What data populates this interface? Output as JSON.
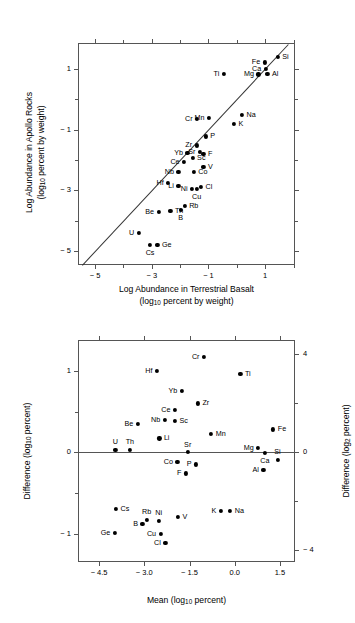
{
  "figure": {
    "type": "two-panel-scientific-figure"
  },
  "chart_data": [
    {
      "type": "scatter",
      "panel": "top",
      "title": "",
      "xlabel": "Log Abundance in Terrestrial Basalt (log10 percent by weight)",
      "ylabel": "Log Abundance in Apollo Rocks (log10 percent by weight)",
      "xlabel_line1": "Log Abundance in Terrestrial Basalt",
      "xlabel_line2_pre": "(log",
      "xlabel_line2_sub": "10",
      "xlabel_line2_post": " percent by weight)",
      "ylabel_line1": "Log Abundance in Apollo Rocks",
      "ylabel_line2_pre": "(log",
      "ylabel_line2_sub": "10",
      "ylabel_line2_post": " percent by weight)",
      "xlim": [
        -5.6,
        2.05
      ],
      "ylim": [
        -5.45,
        1.85
      ],
      "xticks_major": [
        -5,
        -3,
        -1,
        1
      ],
      "xticks_major_labels": [
        "− 5",
        "− 3",
        "− 1",
        "1"
      ],
      "xticks_minor": [
        -4,
        -2,
        0,
        2
      ],
      "yticks_major": [
        1,
        -1,
        -3,
        -5
      ],
      "yticks_major_labels": [
        "1",
        "− 1",
        "− 3",
        "− 5"
      ],
      "yticks_minor": [
        0,
        -2,
        -4
      ],
      "grid": false,
      "reference_line": {
        "type": "identity",
        "label": "y = x",
        "from": [
          -5.45,
          -5.45
        ],
        "to": [
          1.82,
          1.82
        ]
      },
      "points": [
        {
          "label": "Si",
          "x": 1.44,
          "y": 1.4,
          "pos": "r"
        },
        {
          "label": "Fe",
          "x": 0.98,
          "y": 1.21,
          "pos": "l"
        },
        {
          "label": "Ca",
          "x": 1.02,
          "y": 1.0,
          "pos": "l"
        },
        {
          "label": "Al",
          "x": 1.08,
          "y": 0.83,
          "pos": "r"
        },
        {
          "label": "Mg",
          "x": 0.76,
          "y": 0.82,
          "pos": "l"
        },
        {
          "label": "Ti",
          "x": -0.46,
          "y": 0.83,
          "pos": "l"
        },
        {
          "label": "Na",
          "x": 0.18,
          "y": -0.52,
          "pos": "r"
        },
        {
          "label": "K",
          "x": -0.1,
          "y": -0.82,
          "pos": "r"
        },
        {
          "label": "Mn",
          "x": -0.98,
          "y": -0.62,
          "pos": "l"
        },
        {
          "label": "Cr",
          "x": -1.4,
          "y": -0.64,
          "pos": "l"
        },
        {
          "label": "P",
          "x": -1.1,
          "y": -1.22,
          "pos": "r"
        },
        {
          "label": "Zr",
          "x": -1.42,
          "y": -1.52,
          "pos": "l"
        },
        {
          "label": "Sr",
          "x": -1.3,
          "y": -1.72,
          "pos": "l"
        },
        {
          "label": "F",
          "x": -1.18,
          "y": -1.8,
          "pos": "r"
        },
        {
          "label": "Yb",
          "x": -1.74,
          "y": -1.76,
          "pos": "l"
        },
        {
          "label": "Sc",
          "x": -1.56,
          "y": -1.94,
          "pos": "r"
        },
        {
          "label": "Ce",
          "x": -1.86,
          "y": -2.06,
          "pos": "l"
        },
        {
          "label": "V",
          "x": -1.18,
          "y": -2.22,
          "pos": "r"
        },
        {
          "label": "Nb",
          "x": -2.06,
          "y": -2.4,
          "pos": "l"
        },
        {
          "label": "Co",
          "x": -1.52,
          "y": -2.4,
          "pos": "r"
        },
        {
          "label": "Hf",
          "x": -2.42,
          "y": -2.74,
          "pos": "l"
        },
        {
          "label": "Li",
          "x": -2.06,
          "y": -2.84,
          "pos": "l"
        },
        {
          "label": "Cl",
          "x": -1.26,
          "y": -2.88,
          "pos": "r"
        },
        {
          "label": "Ni",
          "x": -1.58,
          "y": -2.94,
          "pos": "l"
        },
        {
          "label": "Cu",
          "x": -1.42,
          "y": -2.94,
          "pos": "b"
        },
        {
          "label": "Rb",
          "x": -1.84,
          "y": -3.5,
          "pos": "r"
        },
        {
          "label": "B",
          "x": -1.98,
          "y": -3.64,
          "pos": "b"
        },
        {
          "label": "Th",
          "x": -2.34,
          "y": -3.68,
          "pos": "r"
        },
        {
          "label": "Be",
          "x": -2.76,
          "y": -3.7,
          "pos": "l"
        },
        {
          "label": "U",
          "x": -3.46,
          "y": -4.4,
          "pos": "l"
        },
        {
          "label": "Cs",
          "x": -3.06,
          "y": -4.78,
          "pos": "b"
        },
        {
          "label": "Ge",
          "x": -2.8,
          "y": -4.8,
          "pos": "r"
        }
      ]
    },
    {
      "type": "scatter",
      "panel": "bottom",
      "title": "",
      "xlabel": "Mean (log10 percent)",
      "ylabel": "Difference (log10 percent)",
      "ylabel_right": "Difference (log2 percent)",
      "xlabel_pre": "Mean (log",
      "xlabel_sub": "10",
      "xlabel_post": " percent)",
      "ylabel_pre": "Difference (log",
      "ylabel_sub": "10",
      "ylabel_post": " percent)",
      "ylabel_right_pre": "Difference (log",
      "ylabel_right_sub": "2",
      "ylabel_right_post": " percent)",
      "xlim": [
        -5.2,
        2.0
      ],
      "ylim": [
        -1.35,
        1.38
      ],
      "xticks_major": [
        -4.5,
        -3.0,
        -1.5,
        0.0,
        1.5
      ],
      "xticks_major_labels": [
        "− 4.5",
        "− 3.0",
        "− 1.5",
        "0.0",
        "1.5"
      ],
      "yticks_major": [
        1,
        0,
        -1
      ],
      "yticks_major_labels": [
        "1",
        "0",
        "− 1"
      ],
      "yticks_minor": [
        0.5,
        -0.5
      ],
      "yticks_right_major": [
        4,
        0,
        -4
      ],
      "yticks_right_major_labels": [
        "4",
        "0",
        "− 4"
      ],
      "yticks_right_minor": [
        2,
        -2
      ],
      "grid": false,
      "reference_line": {
        "type": "horizontal",
        "value": 0
      },
      "points": [
        {
          "label": "Cr",
          "x": -1.02,
          "y": 1.17,
          "pos": "l"
        },
        {
          "label": "Hf",
          "x": -2.58,
          "y": 1.0,
          "pos": "l"
        },
        {
          "label": "Ti",
          "x": 0.19,
          "y": 0.96,
          "pos": "r"
        },
        {
          "label": "Yb",
          "x": -1.76,
          "y": 0.75,
          "pos": "l"
        },
        {
          "label": "Zr",
          "x": -1.22,
          "y": 0.6,
          "pos": "r"
        },
        {
          "label": "Ce",
          "x": -1.98,
          "y": 0.52,
          "pos": "l"
        },
        {
          "label": "Nb",
          "x": -2.32,
          "y": 0.4,
          "pos": "l"
        },
        {
          "label": "Sc",
          "x": -1.98,
          "y": 0.39,
          "pos": "r"
        },
        {
          "label": "Be",
          "x": -3.22,
          "y": 0.35,
          "pos": "l"
        },
        {
          "label": "Fe",
          "x": 1.28,
          "y": 0.28,
          "pos": "r"
        },
        {
          "label": "Mn",
          "x": -0.78,
          "y": 0.23,
          "pos": "r"
        },
        {
          "label": "Li",
          "x": -2.5,
          "y": 0.17,
          "pos": "r"
        },
        {
          "label": "Mg",
          "x": 0.78,
          "y": 0.05,
          "pos": "l"
        },
        {
          "label": "U",
          "x": -3.96,
          "y": 0.03,
          "pos": "t"
        },
        {
          "label": "Th",
          "x": -3.48,
          "y": 0.03,
          "pos": "t"
        },
        {
          "label": "Sr",
          "x": -1.56,
          "y": 0.0,
          "pos": "t"
        },
        {
          "label": "Ca",
          "x": 1.0,
          "y": -0.01,
          "pos": "b"
        },
        {
          "label": "Si",
          "x": 1.42,
          "y": -0.09,
          "pos": "t"
        },
        {
          "label": "Co",
          "x": -1.9,
          "y": -0.12,
          "pos": "l"
        },
        {
          "label": "P",
          "x": -1.28,
          "y": -0.15,
          "pos": "l"
        },
        {
          "label": "Al",
          "x": 0.95,
          "y": -0.22,
          "pos": "l"
        },
        {
          "label": "F",
          "x": -1.62,
          "y": -0.26,
          "pos": "l"
        },
        {
          "label": "Cs",
          "x": -3.94,
          "y": -0.7,
          "pos": "r"
        },
        {
          "label": "K",
          "x": -0.46,
          "y": -0.72,
          "pos": "l"
        },
        {
          "label": "Na",
          "x": -0.15,
          "y": -0.72,
          "pos": "r"
        },
        {
          "label": "V",
          "x": -1.88,
          "y": -0.8,
          "pos": "r"
        },
        {
          "label": "Rb",
          "x": -2.92,
          "y": -0.83,
          "pos": "t"
        },
        {
          "label": "Ni",
          "x": -2.52,
          "y": -0.84,
          "pos": "t"
        },
        {
          "label": "B",
          "x": -3.06,
          "y": -0.88,
          "pos": "l"
        },
        {
          "label": "Ge",
          "x": -3.98,
          "y": -0.99,
          "pos": "l"
        },
        {
          "label": "Cu",
          "x": -2.46,
          "y": -1.0,
          "pos": "l"
        },
        {
          "label": "Cl",
          "x": -2.3,
          "y": -1.12,
          "pos": "l"
        }
      ]
    }
  ]
}
